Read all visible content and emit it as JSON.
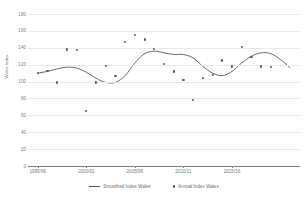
{
  "chart_data": {
    "type": "line",
    "title": "",
    "xlabel": "",
    "ylabel": "Wales Index",
    "ylim": [
      0,
      180
    ],
    "ytick_values": [
      0,
      20,
      40,
      60,
      80,
      100,
      120,
      140,
      160,
      180
    ],
    "ytick_labels": [
      "0",
      "20",
      "40",
      "60",
      "80",
      "100",
      "120",
      "140",
      "160",
      "180"
    ],
    "grid": true,
    "legend_position": "bottom",
    "x_categories": [
      "1995/96",
      "1996/97",
      "1997/98",
      "1998/99",
      "1999/00",
      "2000/01",
      "2001/02",
      "2002/03",
      "2003/04",
      "2004/05",
      "2005/06",
      "2006/07",
      "2007/08",
      "2008/09",
      "2009/10",
      "2010/11",
      "2011/12",
      "2012/13",
      "2013/14",
      "2014/15",
      "2015/16",
      "2016/17",
      "2017/18"
    ],
    "xtick_labels": [
      "1995/96",
      "2000/01",
      "2005/06",
      "2010/11",
      "2015/16"
    ],
    "xtick_indices": [
      0,
      5,
      10,
      15,
      20
    ],
    "series": [
      {
        "name": "Smoothed Index Wales",
        "type": "line",
        "color": "#59595c",
        "values": [
          110,
          112,
          115,
          117,
          116,
          111,
          104,
          99,
          99,
          107,
          122,
          133,
          136,
          134,
          132,
          132,
          128,
          118,
          110,
          107,
          112,
          122,
          130,
          134,
          133,
          126,
          116
        ]
      },
      {
        "name": "Annual Index Wales",
        "type": "scatter",
        "color": "#59595c",
        "values": [
          110,
          113,
          99,
          138,
          137,
          65,
          99,
          119,
          107,
          147,
          155,
          150,
          139,
          121,
          112,
          102,
          78,
          104,
          108,
          125,
          118,
          141,
          129,
          118,
          117
        ]
      }
    ]
  },
  "legend": {
    "items": [
      {
        "label": "Smoothed Index Wales",
        "marker": "line-swatch"
      },
      {
        "label": "Annual Index Wales",
        "marker": "dot-swatch"
      }
    ]
  }
}
